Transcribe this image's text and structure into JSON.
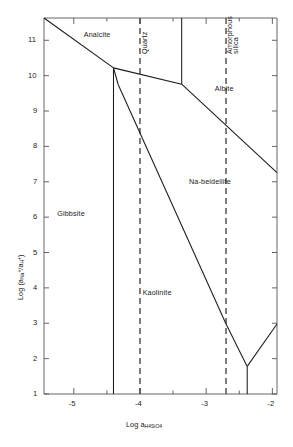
{
  "chart_data": {
    "type": "line",
    "title": "",
    "xlabel": "Log a H4SiO4",
    "ylabel": "Log (a Na+ / a H+)",
    "xlim": [
      -5.45,
      -1.93
    ],
    "ylim": [
      1,
      11.63
    ],
    "xticks_major": [
      -5,
      -4,
      -3,
      -2
    ],
    "xticks_major_labels": [
      "-5",
      "-4",
      "-3",
      "-2"
    ],
    "xticks_minor": [
      -4.5,
      -3.5,
      -2.5
    ],
    "yticks_major": [
      1,
      2,
      3,
      4,
      5,
      6,
      7,
      8,
      9,
      10,
      11
    ],
    "yticks_major_labels": [
      "1",
      "2",
      "3",
      "4",
      "5",
      "6",
      "7",
      "8",
      "9",
      "10",
      "11"
    ],
    "grid": false,
    "legend": "none",
    "field_labels": [
      {
        "name": "Analcite",
        "x": -4.85,
        "y": 11.15,
        "rotated": false
      },
      {
        "name": "Albite",
        "x": -2.87,
        "y": 9.62,
        "rotated": false
      },
      {
        "name": "Na-beidellite",
        "x": -3.26,
        "y": 7.0,
        "rotated": false
      },
      {
        "name": "Gibbsite",
        "x": -5.25,
        "y": 6.1,
        "rotated": false
      },
      {
        "name": "Kaolinite",
        "x": -3.96,
        "y": 3.85,
        "rotated": false
      },
      {
        "name": "Quartz",
        "x": -4.0,
        "y": 10.6,
        "rotated": true
      },
      {
        "name": "Amorphous",
        "x": -2.72,
        "y": 10.6,
        "rotated": true
      },
      {
        "name": "silica",
        "x": -2.62,
        "y": 10.6,
        "rotated": true
      }
    ],
    "saturation_lines": [
      {
        "name": "Quartz",
        "x": -4.0,
        "style": "dashed"
      },
      {
        "name": "Amorphous silica",
        "x": -2.7,
        "style": "dashed"
      }
    ],
    "boundaries": [
      {
        "name": "analcite-albite-upper",
        "points": [
          [
            -5.45,
            11.63
          ],
          [
            -4.4,
            10.22
          ]
        ]
      },
      {
        "name": "analcite-albite-flat",
        "points": [
          [
            -4.4,
            10.22
          ],
          [
            -3.37,
            9.76
          ]
        ]
      },
      {
        "name": "analcite-albite-vert",
        "points": [
          [
            -3.37,
            9.76
          ],
          [
            -3.37,
            11.63
          ]
        ]
      },
      {
        "name": "albite-nabeidellite",
        "points": [
          [
            -3.37,
            9.76
          ],
          [
            -1.93,
            7.26
          ]
        ]
      },
      {
        "name": "analcite-nabeidellite",
        "points": [
          [
            -4.4,
            10.22
          ],
          [
            -4.33,
            9.75
          ]
        ]
      },
      {
        "name": "nabeidellite-kaolinite",
        "points": [
          [
            -4.33,
            9.75
          ],
          [
            -2.7,
            2.98
          ]
        ]
      },
      {
        "name": "gibbsite-kaolinite",
        "points": [
          [
            -4.4,
            10.22
          ],
          [
            -4.4,
            1.0
          ]
        ]
      },
      {
        "name": "kaolinite-right-v-left",
        "points": [
          [
            -2.7,
            2.98
          ],
          [
            -2.38,
            1.78
          ]
        ]
      },
      {
        "name": "kaolinite-right-v-right",
        "points": [
          [
            -2.38,
            1.78
          ],
          [
            -1.93,
            2.98
          ]
        ]
      },
      {
        "name": "v-vertex-drop",
        "points": [
          [
            -2.38,
            1.78
          ],
          [
            -2.38,
            1.0
          ]
        ]
      }
    ]
  },
  "axis": {
    "y_title_prefix": "Log (a",
    "y_title_sub1": "Na",
    "y_title_sup1": "+",
    "y_title_mid": "/a",
    "y_title_sub2": "H",
    "y_title_sup2": "+",
    "y_title_suffix": ")",
    "x_title_prefix": "Log a",
    "x_title_sub": "H",
    "x_title_sub_num1": "4",
    "x_title_si": "SiO",
    "x_title_sub_num2": "4"
  },
  "style": {
    "line_color": "#1a1a1a",
    "frame_color": "#555555",
    "dash_color": "#333333",
    "background": "#ffffff"
  }
}
